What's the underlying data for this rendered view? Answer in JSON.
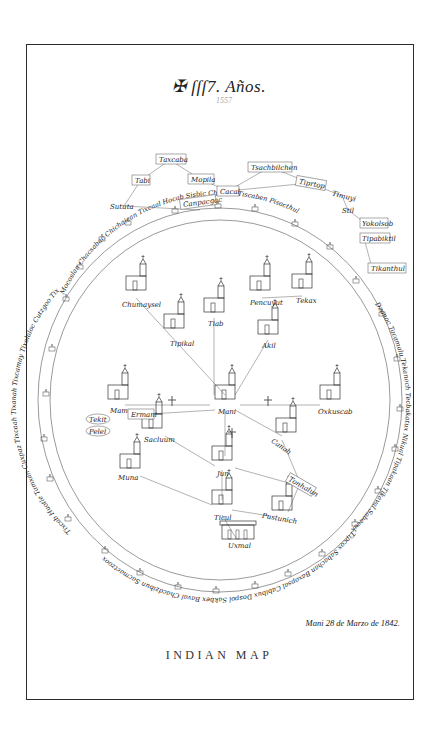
{
  "title": {
    "cross_symbol": "✠",
    "text": "ſſſ7. Años.",
    "year_note": "1557"
  },
  "date_line": "Mani 28 de Marzo de 1842.",
  "caption": "INDIAN MAP",
  "colors": {
    "ink": "#222222",
    "paper": "#ffffff",
    "faint_ink": "#aaaaaa"
  },
  "outer_places": [
    {
      "name": "Taxcaba",
      "x": 170,
      "y": 160
    },
    {
      "name": "Tabi",
      "x": 141,
      "y": 180
    },
    {
      "name": "Mopila",
      "x": 200,
      "y": 179
    },
    {
      "name": "Sututa",
      "x": 124,
      "y": 206
    },
    {
      "name": "Cacal",
      "x": 228,
      "y": 191
    },
    {
      "name": "Canpacgac",
      "x": 200,
      "y": 202
    },
    {
      "name": "Tsachbilchen",
      "x": 270,
      "y": 167
    },
    {
      "name": "Tiprtop",
      "x": 310,
      "y": 183
    },
    {
      "name": "Timuyi",
      "x": 342,
      "y": 196
    },
    {
      "name": "Stil",
      "x": 348,
      "y": 210
    },
    {
      "name": "Yokolsob",
      "x": 365,
      "y": 223
    },
    {
      "name": "Tipabiktil",
      "x": 364,
      "y": 238
    },
    {
      "name": "Tikanthul",
      "x": 372,
      "y": 268
    }
  ],
  "ring_places": {
    "top": "Mocoslan Chacsabac Chichaican Tixcaal Hocab  Sisbic   Chuchic   Tiscaben Pisacthul",
    "right": "Dzonoc  Tacamalu Tekanoch  Tecbakatux Nikual  Tipakaan Tikaval  Sabacukea",
    "bottom": "Tipcox Sabachan Baxopsal Cabibux Dospol Sakbex Baval  Chacdzibun  Sacmactzoox",
    "left": "Tixcab  Huotle  Tamxan  Cuxpaz Tixcaah Tixanah Tixcamay  Tixolaloc Cutzgoo Tixcah Tixcaay"
  },
  "inner_places": [
    {
      "name": "Chumaysel",
      "x": 136,
      "y": 298,
      "icon": "church-icon"
    },
    {
      "name": "Tipikal",
      "x": 174,
      "y": 336,
      "icon": "church-icon"
    },
    {
      "name": "Tiab",
      "x": 214,
      "y": 318,
      "icon": "church-icon"
    },
    {
      "name": "Pencuyut",
      "x": 262,
      "y": 298,
      "icon": "church-icon"
    },
    {
      "name": "Tekax",
      "x": 302,
      "y": 296,
      "icon": "church-icon"
    },
    {
      "name": "Akil",
      "x": 268,
      "y": 340,
      "icon": "church-icon"
    },
    {
      "name": "Mama",
      "x": 117,
      "y": 407,
      "icon": "church-icon"
    },
    {
      "name": "Mani",
      "x": 225,
      "y": 407,
      "icon": "church-icon"
    },
    {
      "name": "Oxkuscab",
      "x": 331,
      "y": 407,
      "icon": "church-icon"
    },
    {
      "name": "Tekit",
      "x": 90,
      "y": 420,
      "icon": "place-icon"
    },
    {
      "name": "Pelel",
      "x": 88,
      "y": 433,
      "icon": "place-icon"
    },
    {
      "name": "Ermani",
      "x": 136,
      "y": 414,
      "icon": "place-icon"
    },
    {
      "name": "Sacluum",
      "x": 152,
      "y": 434,
      "icon": "church-icon"
    },
    {
      "name": "Canah",
      "x": 282,
      "y": 440,
      "icon": "church-icon"
    },
    {
      "name": "Jun",
      "x": 223,
      "y": 468,
      "icon": "church-icon"
    },
    {
      "name": "Tonhalun",
      "x": 298,
      "y": 483,
      "icon": "place-icon"
    },
    {
      "name": "Muna",
      "x": 128,
      "y": 476,
      "icon": "church-icon"
    },
    {
      "name": "Ticul",
      "x": 222,
      "y": 512,
      "icon": "church-icon"
    },
    {
      "name": "Pustunich",
      "x": 280,
      "y": 518,
      "icon": "church-icon"
    },
    {
      "name": "Uxmal",
      "x": 238,
      "y": 550,
      "icon": "temple-icon"
    }
  ]
}
